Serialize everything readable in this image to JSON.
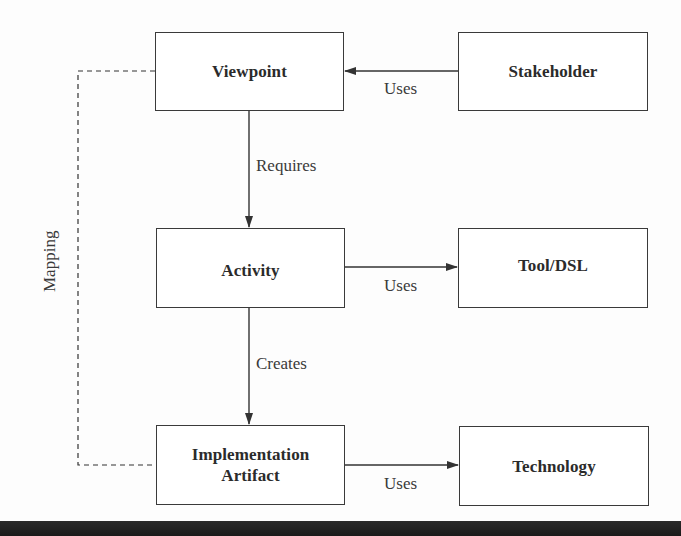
{
  "diagram": {
    "nodes": [
      {
        "id": "viewpoint",
        "label": "Viewpoint"
      },
      {
        "id": "stakeholder",
        "label": "Stakeholder"
      },
      {
        "id": "activity",
        "label": "Activity"
      },
      {
        "id": "tool_dsl",
        "label": "Tool/DSL"
      },
      {
        "id": "implementation_artifact",
        "label": "Implementation Artifact"
      },
      {
        "id": "technology",
        "label": "Technology"
      }
    ],
    "edges": [
      {
        "from": "stakeholder",
        "to": "viewpoint",
        "label": "Uses",
        "style": "solid"
      },
      {
        "from": "viewpoint",
        "to": "activity",
        "label": "Requires",
        "style": "solid"
      },
      {
        "from": "activity",
        "to": "tool_dsl",
        "label": "Uses",
        "style": "solid"
      },
      {
        "from": "activity",
        "to": "implementation_artifact",
        "label": "Creates",
        "style": "solid"
      },
      {
        "from": "implementation_artifact",
        "to": "technology",
        "label": "Uses",
        "style": "solid"
      },
      {
        "from": "viewpoint",
        "to": "implementation_artifact",
        "label": "Mapping",
        "style": "dashed"
      }
    ]
  },
  "labels": {
    "viewpoint": "Viewpoint",
    "stakeholder": "Stakeholder",
    "activity": "Activity",
    "tool_dsl": "Tool/DSL",
    "impl_line1": "Implementation",
    "impl_line2": "Artifact",
    "technology": "Technology",
    "edge_stakeholder_viewpoint": "Uses",
    "edge_viewpoint_activity": "Requires",
    "edge_activity_tool": "Uses",
    "edge_activity_impl": "Creates",
    "edge_impl_technology": "Uses",
    "edge_mapping": "Mapping"
  }
}
